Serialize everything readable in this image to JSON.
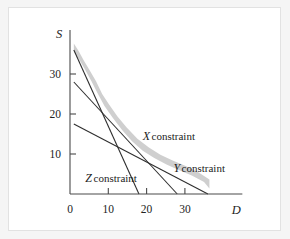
{
  "figure": {
    "background_color": "#f5f5f5",
    "panel_color": "#ffffff",
    "border_color": "#e2e2e2",
    "line_color": "#2e2e2e",
    "band_color": "#cfcfcf"
  },
  "chart_data": {
    "type": "line",
    "title": "",
    "subtitle": "",
    "xlabel": "D",
    "ylabel": "S",
    "xlim": [
      0,
      45
    ],
    "ylim": [
      0,
      40
    ],
    "xticks": [
      0,
      10,
      20,
      30
    ],
    "yticks": [
      10,
      20,
      30
    ],
    "xtick_labels": [
      "0",
      "10",
      "20",
      "30"
    ],
    "ytick_labels": [
      "10",
      "20",
      "30"
    ],
    "grid": false,
    "legend_position": "inline-annotations",
    "series": [
      {
        "name": "X constraint",
        "symbol": "X",
        "label_suffix": "constraint",
        "x": [
          1,
          18
        ],
        "y": [
          36,
          0
        ],
        "x_intercept": 18,
        "y_intercept": 36,
        "label_x": 19,
        "label_y": 13.5
      },
      {
        "name": "Y constraint",
        "symbol": "Y",
        "label_suffix": "constraint",
        "x": [
          1,
          28
        ],
        "y": [
          28,
          0
        ],
        "x_intercept": 28,
        "y_intercept": 28,
        "label_x": 27,
        "label_y": 5.5
      },
      {
        "name": "Z constraint",
        "symbol": "Z",
        "label_suffix": "constraint",
        "x": [
          1,
          36
        ],
        "y": [
          17.5,
          0
        ],
        "x_intercept": 36,
        "y_intercept": 17.5,
        "label_x": 4,
        "label_y": 3.0
      }
    ],
    "feasible_band": {
      "name": "shaded feasible frontier band",
      "description": "irregular grey band tracing the outer envelope of the three constraint lines",
      "outer_x": [
        1.0,
        2.2,
        3.6,
        5.2,
        6.8,
        8.4,
        10.2,
        12.4,
        14.8,
        17.6,
        20.6,
        23.6,
        26.8,
        30.2,
        33.6,
        36.4
      ],
      "outer_y": [
        37.6,
        35.8,
        33.4,
        30.8,
        28.2,
        25.0,
        22.4,
        19.4,
        16.6,
        13.8,
        11.6,
        9.8,
        8.4,
        7.0,
        5.4,
        3.6
      ],
      "inner_x": [
        1.0,
        2.4,
        4.0,
        5.6,
        7.2,
        9.0,
        11.2,
        13.6,
        16.2,
        19.0,
        22.0,
        25.2,
        28.4,
        31.8,
        35.0,
        36.4
      ],
      "inner_y": [
        35.6,
        33.6,
        31.0,
        28.2,
        25.2,
        22.0,
        19.0,
        16.0,
        13.2,
        10.8,
        9.0,
        7.4,
        6.0,
        4.6,
        3.0,
        1.4
      ]
    },
    "annotations": [
      {
        "text": "X constraint"
      },
      {
        "text": "Y constraint"
      },
      {
        "text": "Z constraint"
      }
    ]
  }
}
